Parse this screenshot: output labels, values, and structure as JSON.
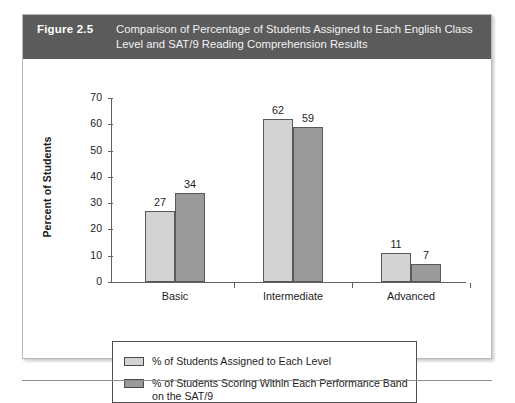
{
  "figure": {
    "number": "Figure 2.5",
    "caption": "Comparison of Percentage of Students Assigned to Each English Class Level and SAT/9 Reading Comprehension Results"
  },
  "colors": {
    "header_band": "#5b5b5b",
    "series_light": "#d2d2d2",
    "series_dark": "#9a9a9a",
    "axis": "#5f5f5f",
    "text": "#1d1d1d"
  },
  "chart_data": {
    "type": "bar",
    "title": "Comparison of Percentage of Students Assigned to Each English Class Level and SAT/9 Reading Comprehension Results",
    "xlabel": "",
    "ylabel": "Percent of Students",
    "ylim": [
      0,
      70
    ],
    "yticks": [
      0,
      10,
      20,
      30,
      40,
      50,
      60,
      70
    ],
    "ytick_labels": [
      "0",
      "10",
      "20",
      "30",
      "40",
      "50",
      "60",
      "70"
    ],
    "grid": false,
    "legend_position": "below-axes",
    "categories": [
      "Basic",
      "Intermediate",
      "Advanced"
    ],
    "series": [
      {
        "name": "% of Students Assigned to Each Level",
        "color": "#d2d2d2",
        "values": [
          27,
          62,
          11
        ],
        "value_labels": [
          "27",
          "62",
          "11"
        ]
      },
      {
        "name": "% of Students Scoring Within Each Performance Band on the SAT/9",
        "color": "#9a9a9a",
        "values": [
          34,
          59,
          7
        ],
        "value_labels": [
          "34",
          "59",
          "7"
        ]
      }
    ]
  },
  "legend": {
    "entries": [
      {
        "label": "% of Students Assigned to Each Level",
        "swatch": "light"
      },
      {
        "label": "% of Students Scoring Within Each Performance Band on the SAT/9",
        "swatch": "dark"
      }
    ]
  }
}
